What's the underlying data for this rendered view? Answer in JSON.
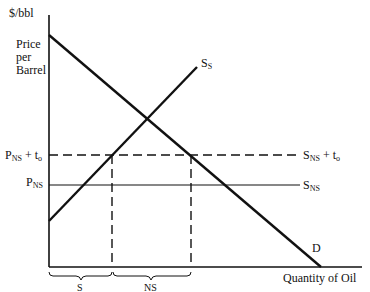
{
  "diagram": {
    "y_axis_unit": "$/bbl",
    "y_axis_title_lines": [
      "Price",
      "per",
      "Barrel"
    ],
    "x_axis_title": "Quantity of Oil",
    "price_levels": {
      "taxed": {
        "main": "P",
        "sub": "NS",
        "suffix": " + t",
        "suffix_sub": "o"
      },
      "untaxed": {
        "main": "P",
        "sub": "NS"
      }
    },
    "curves": {
      "domestic_supply": {
        "main": "S",
        "sub": "S"
      },
      "ns_supply_taxed": {
        "main": "S",
        "sub": "NS",
        "suffix": " + t",
        "suffix_sub": "o"
      },
      "ns_supply": {
        "main": "S",
        "sub": "NS"
      },
      "demand": "D"
    },
    "quantity_brackets": [
      {
        "label": "S"
      },
      {
        "label": "NS"
      }
    ]
  }
}
